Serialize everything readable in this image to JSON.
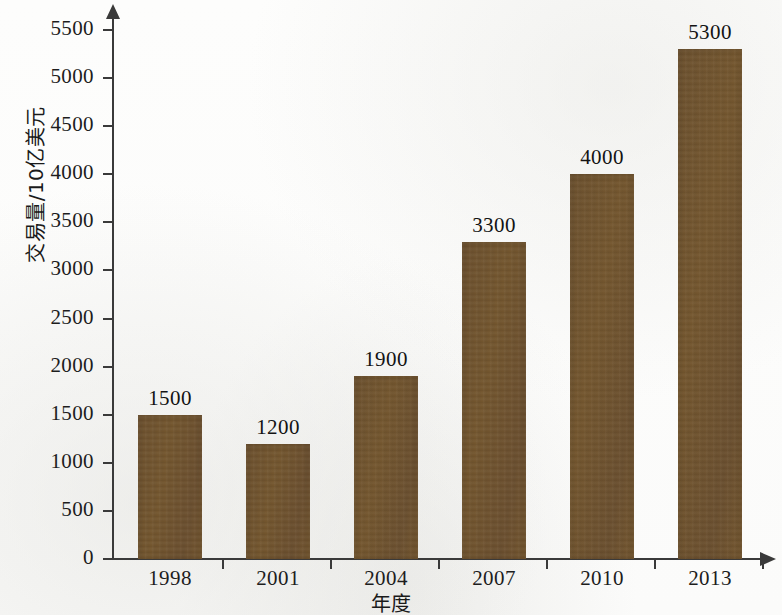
{
  "chart_data": {
    "type": "bar",
    "title": "",
    "xlabel": "年度",
    "ylabel": "交易量/10亿美元",
    "categories": [
      "1998",
      "2001",
      "2004",
      "2007",
      "2010",
      "2013"
    ],
    "values": [
      1500,
      1200,
      1900,
      3300,
      4000,
      5300
    ],
    "value_labels": [
      "1500",
      "1200",
      "1900",
      "3300",
      "4000",
      "5300"
    ],
    "ylim": [
      0,
      5500
    ],
    "ytick_labels": [
      "5500",
      "5000",
      "4500",
      "4000",
      "3500",
      "3000",
      "2500",
      "2000",
      "1500",
      "1000",
      "500",
      "0"
    ],
    "ytick_values": [
      5500,
      5000,
      4500,
      4000,
      3500,
      3000,
      2500,
      2000,
      1500,
      1000,
      500,
      0
    ],
    "ytick_step": 500,
    "grid": false,
    "legend": false,
    "legend_position": "none",
    "bar_color": "#6f5430",
    "axis_color": "#3a3a3a",
    "background_color": "#fdfdfc",
    "axis_arrows": true,
    "series": [
      {
        "name": "交易量",
        "values": [
          1500,
          1200,
          1900,
          3300,
          4000,
          5300
        ]
      }
    ]
  }
}
